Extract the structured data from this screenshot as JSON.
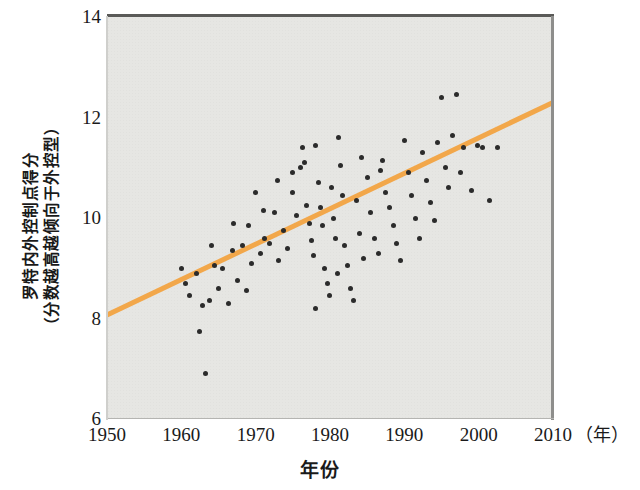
{
  "chart_data": {
    "type": "scatter",
    "title": "",
    "xlabel": "年份",
    "xunit": "（年）",
    "ylabel_line1": "罗特内外控制点得分",
    "ylabel_line2": "（分数越高越倾向于外控型）",
    "xlim": [
      1950,
      2010
    ],
    "ylim": [
      6,
      14
    ],
    "xticks": [
      1950,
      1960,
      1970,
      1980,
      1990,
      2000,
      2010
    ],
    "yticks": [
      6,
      8,
      10,
      12,
      14
    ],
    "grid": false,
    "legend": "none",
    "plot_background_color": "#E6E6E3",
    "point_color": "#2B2B2B",
    "trendline_color": "#F2A74A",
    "trendline": {
      "type": "line",
      "name": "线性趋势线",
      "x": [
        1950,
        2010
      ],
      "y": [
        8.07,
        12.3
      ]
    },
    "series": [
      {
        "name": "罗特内外控制点得分",
        "points": [
          [
            1960.0,
            9.0
          ],
          [
            1960.6,
            8.7
          ],
          [
            1961.1,
            8.45
          ],
          [
            1962.0,
            8.9
          ],
          [
            1962.4,
            7.75
          ],
          [
            1962.8,
            8.25
          ],
          [
            1963.2,
            6.9
          ],
          [
            1963.8,
            8.35
          ],
          [
            1964.4,
            9.05
          ],
          [
            1965.0,
            8.6
          ],
          [
            1965.6,
            9.0
          ],
          [
            1966.3,
            8.3
          ],
          [
            1966.9,
            9.35
          ],
          [
            1967.6,
            8.75
          ],
          [
            1968.2,
            9.45
          ],
          [
            1968.8,
            8.55
          ],
          [
            1969.4,
            9.1
          ],
          [
            1970.0,
            10.5
          ],
          [
            1970.6,
            9.3
          ],
          [
            1971.2,
            9.6
          ],
          [
            1971.9,
            9.5
          ],
          [
            1972.5,
            10.1
          ],
          [
            1973.1,
            9.15
          ],
          [
            1973.7,
            9.75
          ],
          [
            1974.3,
            9.4
          ],
          [
            1974.9,
            10.9
          ],
          [
            1975.5,
            10.05
          ],
          [
            1976.0,
            11.0
          ],
          [
            1976.3,
            11.4
          ],
          [
            1976.6,
            11.1
          ],
          [
            1976.9,
            10.25
          ],
          [
            1977.2,
            9.9
          ],
          [
            1977.5,
            9.55
          ],
          [
            1977.8,
            9.25
          ],
          [
            1978.1,
            11.45
          ],
          [
            1978.4,
            10.7
          ],
          [
            1978.7,
            10.2
          ],
          [
            1979.0,
            9.85
          ],
          [
            1979.3,
            9.0
          ],
          [
            1979.6,
            8.7
          ],
          [
            1979.9,
            8.45
          ],
          [
            1980.2,
            10.6
          ],
          [
            1980.5,
            10.0
          ],
          [
            1980.8,
            9.6
          ],
          [
            1981.1,
            11.6
          ],
          [
            1981.4,
            11.05
          ],
          [
            1981.7,
            10.45
          ],
          [
            1982.0,
            9.45
          ],
          [
            1982.4,
            9.05
          ],
          [
            1982.8,
            8.6
          ],
          [
            1983.2,
            8.35
          ],
          [
            1983.6,
            10.35
          ],
          [
            1984.0,
            9.7
          ],
          [
            1984.5,
            9.2
          ],
          [
            1985.0,
            10.8
          ],
          [
            1985.5,
            10.1
          ],
          [
            1986.0,
            9.6
          ],
          [
            1986.5,
            9.3
          ],
          [
            1987.0,
            11.15
          ],
          [
            1987.5,
            10.5
          ],
          [
            1988.0,
            10.2
          ],
          [
            1988.5,
            9.85
          ],
          [
            1989.0,
            9.5
          ],
          [
            1989.5,
            9.15
          ],
          [
            1990.0,
            11.55
          ],
          [
            1990.5,
            10.9
          ],
          [
            1991.0,
            10.45
          ],
          [
            1991.5,
            10.0
          ],
          [
            1992.0,
            9.6
          ],
          [
            1992.5,
            11.3
          ],
          [
            1993.0,
            10.75
          ],
          [
            1993.5,
            10.3
          ],
          [
            1994.0,
            9.95
          ],
          [
            1994.5,
            11.5
          ],
          [
            1995.0,
            12.4
          ],
          [
            1995.5,
            11.0
          ],
          [
            1996.0,
            10.6
          ],
          [
            1996.5,
            11.65
          ],
          [
            1997.0,
            12.45
          ],
          [
            1997.5,
            10.9
          ],
          [
            1998.0,
            11.4
          ],
          [
            1999.0,
            10.55
          ],
          [
            1999.8,
            11.45
          ],
          [
            2000.5,
            11.4
          ],
          [
            2001.5,
            10.35
          ],
          [
            2002.5,
            11.4
          ],
          [
            1975.0,
            10.5
          ],
          [
            1973.0,
            10.75
          ],
          [
            1971.0,
            10.15
          ],
          [
            1969.0,
            9.85
          ],
          [
            1967.0,
            9.9
          ],
          [
            1964.0,
            9.45
          ],
          [
            1986.8,
            10.95
          ],
          [
            1984.2,
            11.2
          ],
          [
            1981.0,
            8.9
          ],
          [
            1978.0,
            8.2
          ]
        ]
      }
    ]
  }
}
